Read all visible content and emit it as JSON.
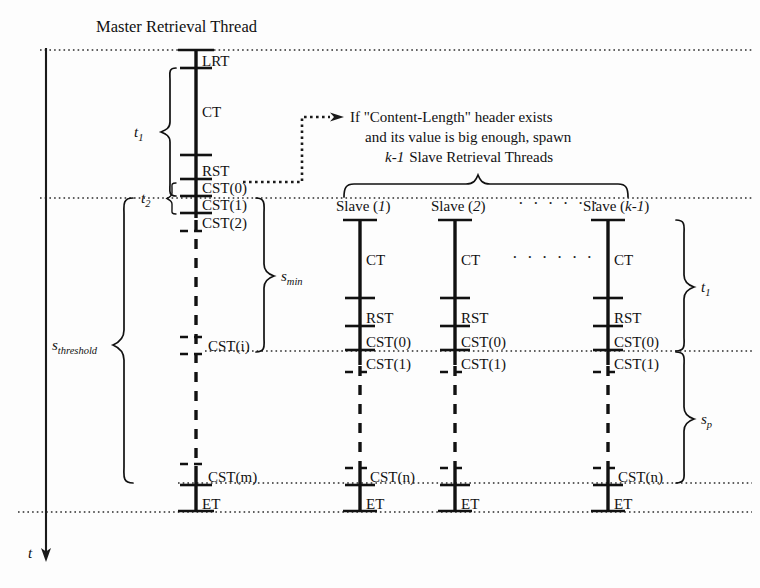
{
  "diagram": {
    "title": "Master Retrieval Thread",
    "time_axis_label": "t",
    "annotation": {
      "line1": "If \"Content-Length\" header exists",
      "line2": "and its value is big enough, spawn",
      "line3_italic": "k-1",
      "line3_rest": "Slave Retrieval Threads"
    },
    "master_thread": {
      "name": "Master Retrieval Thread",
      "events": [
        {
          "label": "LRT",
          "y": 68
        },
        {
          "label": "CT",
          "y": 105
        },
        {
          "label": "RST",
          "y": 158
        },
        {
          "label": "CST(0)",
          "y": 182,
          "paren_italic": "0"
        },
        {
          "label": "CST(1)",
          "y": 198,
          "paren_italic": "1"
        },
        {
          "label": "CST(2)",
          "y": 215,
          "paren_italic": "2"
        },
        {
          "label": "CST(i)",
          "y": 340,
          "paren_italic": "i"
        },
        {
          "label": "CST(m)",
          "y": 470,
          "paren_italic": "m"
        },
        {
          "label": "ET",
          "y": 498
        }
      ]
    },
    "slaves": [
      {
        "name": "Slave (1)",
        "name_base": "Slave (",
        "name_italic": "1",
        "events": [
          "CT",
          "RST",
          "CST(0)",
          "CST(1)",
          "CST(n)",
          "ET"
        ]
      },
      {
        "name": "Slave (2)",
        "name_base": "Slave (",
        "name_italic": "2",
        "events": [
          "CT",
          "RST",
          "CST(0)",
          "CST(1)",
          "ET"
        ]
      },
      {
        "name": "Slave (k-1)",
        "name_base": "Slave (",
        "name_italic": "k-1",
        "events": [
          "CT",
          "RST",
          "CST(0)",
          "CST(1)",
          "CST(n)",
          "ET"
        ]
      }
    ],
    "ellipsis_header": "· · · · · ·",
    "ellipsis_body": "· · · · · ·",
    "measures": {
      "t1_master": {
        "label": "t",
        "sub": "1"
      },
      "t2_master": {
        "label": "t",
        "sub": "2"
      },
      "s_min": {
        "label": "s",
        "sub": "min"
      },
      "s_threshold": {
        "label": "s",
        "sub": "threshold"
      },
      "t1_slave": {
        "label": "t",
        "sub": "1"
      },
      "s_p": {
        "label": "s",
        "sub": "p"
      }
    },
    "colors": {
      "ink": "#111111",
      "background": "#fdfdfd",
      "dotted_line": "#2b2b2b"
    }
  }
}
